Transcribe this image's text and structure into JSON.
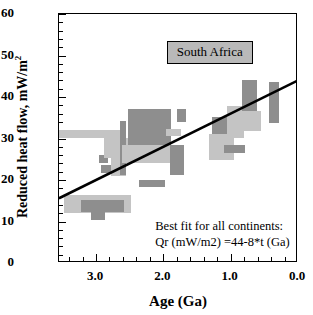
{
  "chart_data": {
    "type": "scatter",
    "title": "",
    "region_label": "South Africa",
    "xlabel": "Age (Ga)",
    "ylabel": "Reduced heat flow, mW/m",
    "ylabel_sup": "2",
    "xlim": [
      3.55,
      0.0
    ],
    "ylim": [
      0,
      60
    ],
    "x_reversed": true,
    "grid": false,
    "xticks": [
      3.0,
      2.0,
      1.0,
      0.0
    ],
    "xticklabels": [
      "3.0",
      "2.0",
      "1.0",
      "0.0"
    ],
    "x_minor_step": 0.2,
    "yticks": [
      0,
      10,
      20,
      30,
      40,
      50,
      60
    ],
    "yticklabels": [
      "0",
      "10",
      "20",
      "30",
      "40",
      "50",
      "60"
    ],
    "y_minor_step": 2,
    "annotation_line1": "Best fit for all continents:",
    "annotation_line2": "Qr (mW/m2) =44-8*t (Ga)",
    "fit": {
      "equation": "Qr = 44 - 8*t",
      "intercept": 44,
      "slope": -8,
      "x_start": 3.55,
      "y_start": 15.6,
      "x_end": 0.0,
      "y_end": 44.0,
      "color": "#000000",
      "linewidth": 2.6
    },
    "colors": {
      "dark_gray": "#8e8e8e",
      "light_gray": "#c4c4c4",
      "legend_fill": "#b9b9b9",
      "axis": "#000000"
    },
    "boxes": [
      {
        "name": "light-bar-3.5-2.65-30-32",
        "x0": 3.55,
        "x1": 2.62,
        "y0": 30.0,
        "y1": 32.0,
        "shade": "light"
      },
      {
        "name": "dark-sq-2.92-25",
        "x0": 2.95,
        "x1": 2.82,
        "y0": 24.2,
        "y1": 26.0,
        "shade": "dark"
      },
      {
        "name": "light-block-2.85-2.45-25-30",
        "x0": 2.88,
        "x1": 2.48,
        "y0": 25.2,
        "y1": 30.2,
        "shade": "light"
      },
      {
        "name": "dark-bar-2.9-2.75-22-23.5",
        "x0": 2.93,
        "x1": 2.74,
        "y0": 21.8,
        "y1": 23.6,
        "shade": "dark"
      },
      {
        "name": "light-sq-2.76-2.55-21-26",
        "x0": 2.78,
        "x1": 2.56,
        "y0": 21.0,
        "y1": 26.2,
        "shade": "light"
      },
      {
        "name": "dark-tall-2.63-2.55-27-34",
        "x0": 2.64,
        "x1": 2.55,
        "y0": 27.4,
        "y1": 34.1,
        "shade": "dark"
      },
      {
        "name": "dark-tall-2.63-2.55-21-29",
        "x0": 2.64,
        "x1": 2.55,
        "y0": 21.2,
        "y1": 29.0,
        "shade": "dark"
      },
      {
        "name": "dark-big-2.5-1.9-28-37",
        "x0": 2.52,
        "x1": 1.88,
        "y0": 28.0,
        "y1": 37.0,
        "shade": "dark"
      },
      {
        "name": "light-wide-2.6-1.75-24-28.5",
        "x0": 2.62,
        "x1": 1.74,
        "y0": 24.1,
        "y1": 28.4,
        "shade": "light"
      },
      {
        "name": "dark-bar-2.35-2.0-18.5-20",
        "x0": 2.36,
        "x1": 1.98,
        "y0": 18.4,
        "y1": 20.0,
        "shade": "dark"
      },
      {
        "name": "light-low-3.45-2.5-12-16.5",
        "x0": 3.48,
        "x1": 2.48,
        "y0": 12.1,
        "y1": 16.5,
        "shade": "light"
      },
      {
        "name": "dark-low-3.2-2.6-12.2-15",
        "x0": 3.22,
        "x1": 2.58,
        "y0": 12.2,
        "y1": 15.1,
        "shade": "dark"
      },
      {
        "name": "dark-low-3.05-2.85-10.5-12.5",
        "x0": 3.07,
        "x1": 2.86,
        "y0": 10.4,
        "y1": 12.6,
        "shade": "dark"
      },
      {
        "name": "light-sq-1.95-1.75-31-32",
        "x0": 1.96,
        "x1": 1.74,
        "y0": 30.6,
        "y1": 32.2,
        "shade": "light"
      },
      {
        "name": "dark-sq-1.9-1.7-21-28.5",
        "x0": 1.9,
        "x1": 1.69,
        "y0": 21.1,
        "y1": 28.5,
        "shade": "dark"
      },
      {
        "name": "dark-sq-1.78-1.66-34-37",
        "x0": 1.79,
        "x1": 1.66,
        "y0": 34.0,
        "y1": 37.2,
        "shade": "dark"
      },
      {
        "name": "dark-mid-1.25-1.05-30-35",
        "x0": 1.27,
        "x1": 1.05,
        "y0": 30.0,
        "y1": 35.2,
        "shade": "dark"
      },
      {
        "name": "light-mid-1.3-0.95-25-31",
        "x0": 1.32,
        "x1": 0.95,
        "y0": 24.9,
        "y1": 31.2,
        "shade": "light"
      },
      {
        "name": "light-tall-1.05-0.80-30-38",
        "x0": 1.06,
        "x1": 0.8,
        "y0": 30.1,
        "y1": 37.8,
        "shade": "light"
      },
      {
        "name": "dark-bar-1.1-0.78-26.5-28.5",
        "x0": 1.1,
        "x1": 0.78,
        "y0": 26.4,
        "y1": 28.4,
        "shade": "dark"
      },
      {
        "name": "dark-tall-0.82-0.60-32-44",
        "x0": 0.83,
        "x1": 0.61,
        "y0": 32.0,
        "y1": 44.0,
        "shade": "dark"
      },
      {
        "name": "light-wide-0.95-0.55-32-36.5",
        "x0": 0.96,
        "x1": 0.55,
        "y0": 31.9,
        "y1": 36.6,
        "shade": "light"
      },
      {
        "name": "dark-right-0.42-0.28-34-43.5",
        "x0": 0.43,
        "x1": 0.28,
        "y0": 33.8,
        "y1": 43.5,
        "shade": "dark"
      }
    ]
  }
}
